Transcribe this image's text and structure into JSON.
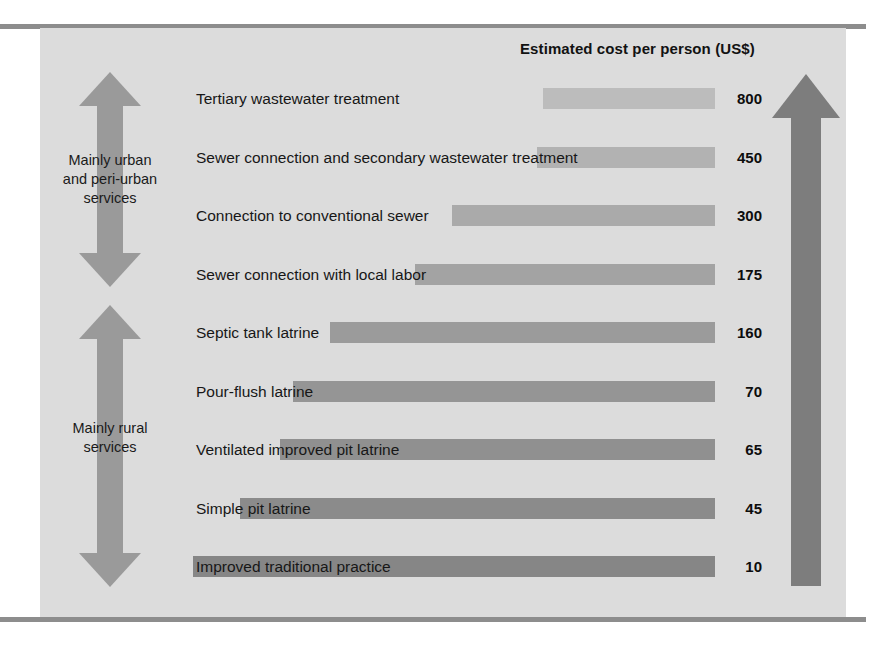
{
  "chart_data": {
    "type": "bar",
    "title": "Estimated cost per person (US$)",
    "xlabel": "",
    "ylabel": "",
    "orientation": "horizontal",
    "grid": false,
    "legend": "none",
    "categories": [
      "Tertiary wastewater treatment",
      "Sewer connection and secondary wastewater treatment",
      "Connection to conventional sewer",
      "Sewer connection with local labor",
      "Septic tank latrine",
      "Pour-flush latrine",
      "Ventilated improved pit latrine",
      "Simple pit latrine",
      "Improved traditional practice"
    ],
    "values": [
      800,
      450,
      300,
      175,
      160,
      70,
      65,
      45,
      10
    ],
    "value_labels": [
      "800",
      "450",
      "300",
      "175",
      "160",
      "70",
      "65",
      "45",
      "10"
    ],
    "bar_colors": [
      "#bcbcbc",
      "#b2b2b2",
      "#aaaaaa",
      "#a3a3a3",
      "#9b9b9b",
      "#959595",
      "#909090",
      "#8b8b8b",
      "#868686"
    ],
    "bar_left_px": [
      543,
      537,
      452,
      415,
      330,
      293,
      280,
      240,
      193
    ],
    "bar_right_px": 715,
    "annotations": [
      "Mainly urban and peri-urban services",
      "Mainly rural services"
    ]
  },
  "panel": {
    "background": "#dcdcdc",
    "rule_color": "#8d8d8d"
  },
  "groups": [
    {
      "label_line1": "Mainly urban",
      "label_line2": "and peri-urban",
      "label_line3": "services",
      "arrow": "double-headed-vertical-arrow",
      "color": "#9a9a9a"
    },
    {
      "label_line1": "Mainly rural",
      "label_line2": "services",
      "label_line3": "",
      "arrow": "double-headed-vertical-arrow",
      "color": "#9a9a9a"
    }
  ],
  "right_arrow": {
    "name": "increasing-cost-arrow",
    "direction": "up",
    "color": "#7d7d7d"
  }
}
